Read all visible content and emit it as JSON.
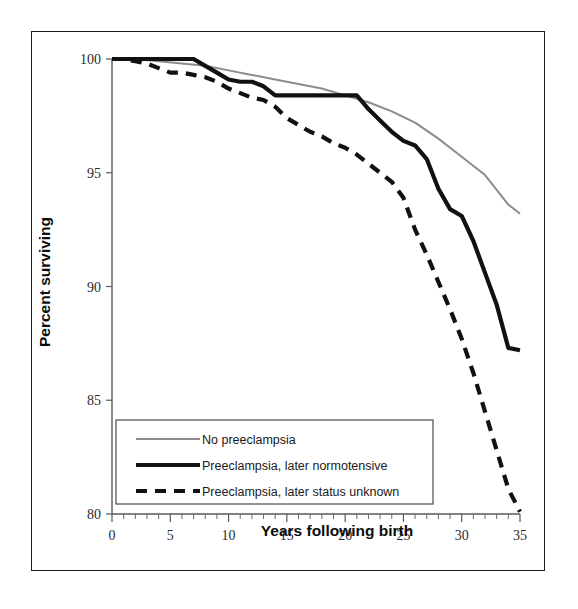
{
  "chart_data": {
    "type": "line",
    "title": "",
    "subtitle": "",
    "xlabel": "Years following birth",
    "ylabel": "Percent surviving",
    "xlim": [
      0,
      35
    ],
    "ylim": [
      80,
      100
    ],
    "x_ticks": [
      0,
      5,
      10,
      15,
      20,
      25,
      30,
      35
    ],
    "x_tick_labels": [
      "0",
      "5",
      "10",
      "15",
      "20",
      "25",
      "30",
      "35"
    ],
    "x_minor_tick_step": 1,
    "y_ticks": [
      80,
      85,
      90,
      95,
      100
    ],
    "y_tick_labels": [
      "80",
      "85",
      "90",
      "95",
      "100"
    ],
    "grid": false,
    "legend_position": "lower-left-inside",
    "series": [
      {
        "name": "No preeclampsia",
        "style": "thin-gray-solid",
        "color": "#8c8c8c",
        "width": 2.0,
        "dash": "none",
        "x": [
          0,
          2,
          4,
          6,
          8,
          10,
          12,
          14,
          16,
          18,
          20,
          22,
          24,
          26,
          28,
          30,
          32,
          34,
          35
        ],
        "y": [
          100.0,
          100.0,
          99.9,
          99.8,
          99.7,
          99.5,
          99.3,
          99.1,
          98.9,
          98.7,
          98.4,
          98.1,
          97.7,
          97.2,
          96.5,
          95.7,
          94.9,
          93.6,
          93.2
        ]
      },
      {
        "name": "Preeclampsia, later normotensive",
        "style": "thick-black-solid",
        "color": "#111111",
        "width": 4.2,
        "dash": "none",
        "x": [
          0,
          2,
          4,
          6,
          7,
          8,
          9,
          10,
          11,
          12,
          13,
          14,
          16,
          18,
          20,
          21,
          22,
          23,
          24,
          25,
          26,
          27,
          28,
          29,
          30,
          31,
          32,
          33,
          34,
          35
        ],
        "y": [
          100.0,
          100.0,
          100.0,
          100.0,
          100.0,
          99.7,
          99.4,
          99.1,
          99.0,
          99.0,
          98.8,
          98.4,
          98.4,
          98.4,
          98.4,
          98.4,
          97.8,
          97.3,
          96.8,
          96.4,
          96.2,
          95.6,
          94.3,
          93.4,
          93.1,
          92.0,
          90.6,
          89.2,
          87.3,
          87.2
        ]
      },
      {
        "name": "Preeclampsia, later status unknown",
        "style": "thick-black-dashed",
        "color": "#111111",
        "width": 4.2,
        "dash": "11 8",
        "x": [
          0,
          1,
          2,
          3,
          4,
          5,
          6,
          7,
          8,
          9,
          10,
          11,
          12,
          13,
          14,
          15,
          16,
          17,
          18,
          19,
          20,
          21,
          22,
          23,
          24,
          25,
          26,
          27,
          28,
          29,
          30,
          31,
          32,
          33,
          34,
          35
        ],
        "y": [
          100.0,
          100.0,
          99.9,
          99.8,
          99.6,
          99.4,
          99.4,
          99.3,
          99.2,
          99.0,
          98.7,
          98.5,
          98.3,
          98.2,
          97.9,
          97.4,
          97.1,
          96.8,
          96.6,
          96.3,
          96.1,
          95.8,
          95.4,
          95.0,
          94.6,
          93.9,
          92.5,
          91.4,
          90.2,
          89.0,
          87.7,
          86.2,
          84.5,
          82.8,
          81.1,
          80.1
        ]
      }
    ]
  },
  "axes": {
    "x_title": "Years following birth",
    "y_title": "Percent surviving"
  },
  "legend": {
    "items": [
      {
        "label": "No preeclampsia"
      },
      {
        "label": "Preeclampsia, later normotensive"
      },
      {
        "label": "Preeclampsia, later status unknown"
      }
    ]
  }
}
